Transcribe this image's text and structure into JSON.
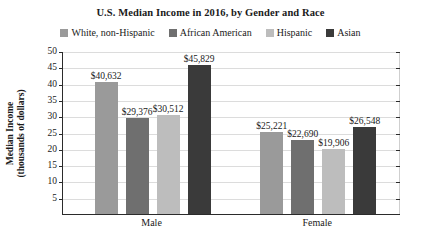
{
  "chart_data": {
    "type": "bar",
    "title": "U.S. Median Income in 2016, by Gender and Race",
    "xlabel": "",
    "ylabel_line1": "Median Income",
    "ylabel_line2": "(thousands of dollars)",
    "categories": [
      "Male",
      "Female"
    ],
    "ylim": [
      0,
      50
    ],
    "yticks": [
      5,
      10,
      15,
      20,
      25,
      30,
      35,
      40,
      45,
      50
    ],
    "ytick_labels": [
      "5",
      "10",
      "15",
      "20",
      "25",
      "30",
      "35",
      "40",
      "45",
      "50"
    ],
    "grid": true,
    "legend_position": "top",
    "units": "thousands of dollars",
    "series": [
      {
        "name": "White, non-Hispanic",
        "color": "#9a9a9a",
        "values": [
          40.632,
          25.221
        ],
        "labels": [
          "$40,632",
          "$25,221"
        ]
      },
      {
        "name": "African American",
        "color": "#6f6f6f",
        "values": [
          29.376,
          22.69
        ],
        "labels": [
          "$29,376",
          "$22,690"
        ]
      },
      {
        "name": "Hispanic",
        "color": "#bdbdbd",
        "values": [
          30.512,
          19.906
        ],
        "labels": [
          "$30,512",
          "$19,906"
        ]
      },
      {
        "name": "Asian",
        "color": "#3a3a3a",
        "values": [
          45.829,
          26.548
        ],
        "labels": [
          "$45,829",
          "$26,548"
        ]
      }
    ]
  }
}
